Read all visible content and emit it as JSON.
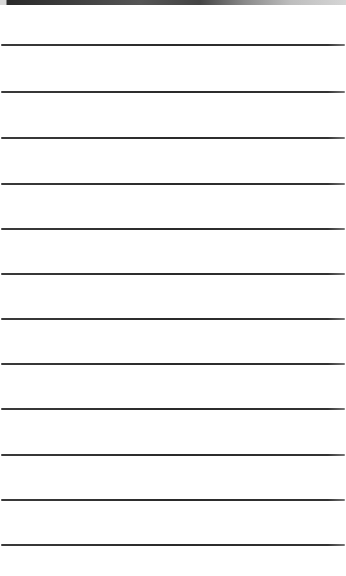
{
  "page": {
    "background": "#ffffff",
    "line_color": "#2e2e2e",
    "top_band": {
      "height_px": 5,
      "color_from": "#2a2a2a",
      "color_to": "#d6d6d6"
    },
    "lines": [
      {
        "y": 44
      },
      {
        "y": 91
      },
      {
        "y": 137
      },
      {
        "y": 183
      },
      {
        "y": 228
      },
      {
        "y": 273
      },
      {
        "y": 318
      },
      {
        "y": 363
      },
      {
        "y": 408
      },
      {
        "y": 454
      },
      {
        "y": 499
      },
      {
        "y": 544
      }
    ]
  }
}
